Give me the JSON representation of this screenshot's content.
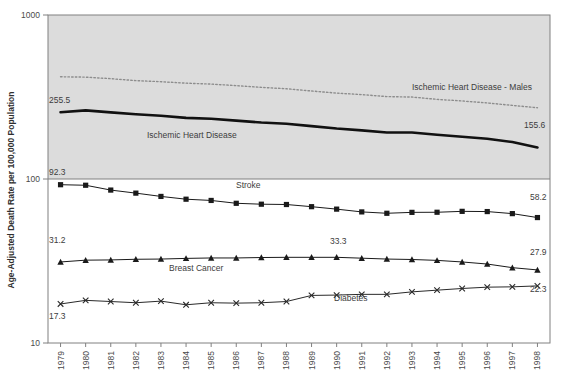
{
  "chart_data": {
    "type": "line",
    "title": "",
    "subtitle": "",
    "xlabel": "",
    "ylabel": "Age-Adjusted Death Rate per 100,000 Population",
    "yscale": "log",
    "ylim": [
      10,
      1000
    ],
    "ytick_labels": [
      "1000",
      "100",
      "10"
    ],
    "ytick_values": [
      1000,
      100,
      10
    ],
    "grid": false,
    "legend_position": "inline-annotations",
    "x": [
      1979,
      1980,
      1981,
      1982,
      1983,
      1984,
      1985,
      1986,
      1987,
      1988,
      1989,
      1990,
      1991,
      1992,
      1993,
      1994,
      1995,
      1996,
      1997,
      1998
    ],
    "categories": [
      "1979",
      "1980",
      "1981",
      "1982",
      "1983",
      "1984",
      "1985",
      "1986",
      "1987",
      "1988",
      "1989",
      "1990",
      "1991",
      "1992",
      "1993",
      "1994",
      "1995",
      "1996",
      "1997",
      "1998"
    ],
    "series": [
      {
        "name": "Ischemic Heart Disease - Males",
        "style": "dotted",
        "marker": "none",
        "color": "#8d8d8d",
        "values": [
          420.0,
          418.0,
          409.0,
          398.0,
          392.0,
          384.0,
          379.0,
          371.0,
          362.0,
          355.0,
          344.0,
          334.0,
          327.0,
          318.0,
          316.0,
          306.0,
          299.0,
          291.0,
          281.0,
          272.0
        ]
      },
      {
        "name": "Ischemic Heart Disease",
        "style": "solid-thick",
        "marker": "none",
        "color": "#111111",
        "values": [
          255.5,
          262.0,
          255.0,
          248.0,
          243.0,
          236.0,
          233.0,
          227.0,
          221.0,
          217.0,
          210.0,
          203.0,
          198.0,
          192.0,
          192.0,
          186.0,
          181.0,
          176.0,
          168.0,
          155.6
        ]
      },
      {
        "name": "Stroke",
        "style": "solid",
        "marker": "square",
        "color": "#1a1a1a",
        "values": [
          92.3,
          91.6,
          85.6,
          82.0,
          78.3,
          75.3,
          74.0,
          71.1,
          70.2,
          69.9,
          67.8,
          65.5,
          63.0,
          61.8,
          62.6,
          62.7,
          63.5,
          63.3,
          61.5,
          58.2
        ]
      },
      {
        "name": "Breast Cancer",
        "style": "solid",
        "marker": "triangle",
        "color": "#1a1a1a",
        "values": [
          31.2,
          32.0,
          32.1,
          32.4,
          32.5,
          32.8,
          33.0,
          33.0,
          33.2,
          33.3,
          33.3,
          33.3,
          32.9,
          32.5,
          32.3,
          31.9,
          31.2,
          30.3,
          28.8,
          27.9
        ]
      },
      {
        "name": "Diabetes",
        "style": "solid",
        "marker": "x",
        "color": "#2a2a2a",
        "values": [
          17.3,
          18.2,
          17.9,
          17.6,
          18.0,
          17.1,
          17.6,
          17.5,
          17.6,
          17.9,
          19.5,
          19.6,
          19.8,
          19.8,
          20.5,
          21.0,
          21.5,
          21.9,
          22.0,
          22.3
        ]
      }
    ],
    "point_annotations": [
      {
        "text": "255.5",
        "series": "Ischemic Heart Disease",
        "side": "left",
        "x_px": 49,
        "y_px": 103
      },
      {
        "text": "155.6",
        "series": "Ischemic Heart Disease",
        "side": "right",
        "x_px": 524,
        "y_px": 128
      },
      {
        "text": "92.3",
        "series": "Stroke",
        "side": "left",
        "x_px": 49,
        "y_px": 175
      },
      {
        "text": "58.2",
        "series": "Stroke",
        "side": "right",
        "x_px": 530,
        "y_px": 200
      },
      {
        "text": "31.2",
        "series": "Breast Cancer",
        "side": "left",
        "x_px": 49,
        "y_px": 243
      },
      {
        "text": "33.3",
        "series": "Breast Cancer",
        "side": "top",
        "x_px": 330,
        "y_px": 244
      },
      {
        "text": "27.9",
        "series": "Breast Cancer",
        "side": "right",
        "x_px": 530,
        "y_px": 255
      },
      {
        "text": "17.3",
        "series": "Diabetes",
        "side": "bottom",
        "x_px": 49,
        "y_px": 319
      },
      {
        "text": "22.3",
        "series": "Diabetes",
        "side": "right",
        "x_px": 530,
        "y_px": 292
      }
    ],
    "inline_series_labels": [
      {
        "text": "Ischemic Heart Disease - Males",
        "x_px": 412,
        "y_px": 90
      },
      {
        "text": "Ischemic Heart Disease",
        "x_px": 147,
        "y_px": 138
      },
      {
        "text": "Stroke",
        "x_px": 236,
        "y_px": 188
      },
      {
        "text": "Breast Cancer",
        "x_px": 169,
        "y_px": 271
      },
      {
        "text": "Diabetes",
        "x_px": 334,
        "y_px": 301
      }
    ],
    "colors": {
      "plot_background_upper": "#dcdcdc",
      "plot_background_lower": "#ffffff",
      "axis": "#808080",
      "text": "#4a4a4a",
      "ihd_males": "#8d8d8d",
      "ihd": "#111111",
      "stroke": "#1a1a1a",
      "breast_cancer": "#1a1a1a",
      "diabetes": "#2a2a2a"
    }
  }
}
